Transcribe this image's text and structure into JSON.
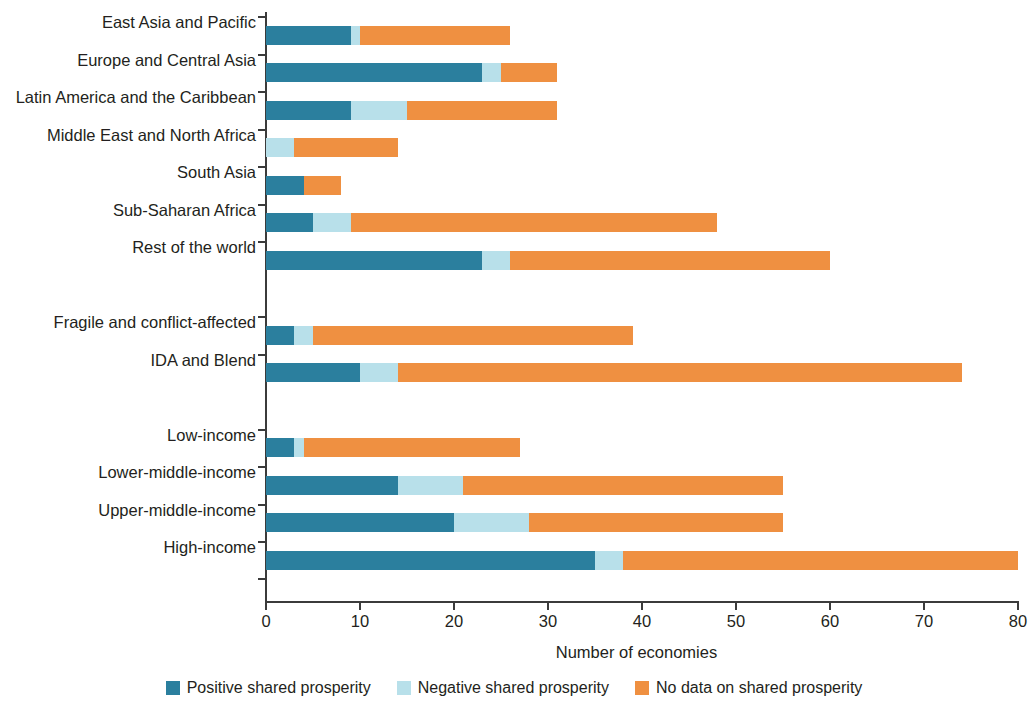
{
  "chart_data": {
    "type": "bar",
    "orientation": "horizontal",
    "stacked": true,
    "title": "",
    "xlabel": "Number of economies",
    "ylabel": "",
    "xlim": [
      0,
      80
    ],
    "xticks": [
      0,
      10,
      20,
      30,
      40,
      50,
      60,
      70,
      80
    ],
    "grid": false,
    "legend_position": "bottom",
    "categories": [
      "East Asia and Pacific",
      "Europe and Central Asia",
      "Latin America and the Caribbean",
      "Middle East and North Africa",
      "South Asia",
      "Sub-Saharan Africa",
      "Rest of the world",
      "Fragile and conflict-affected",
      "IDA and Blend",
      "Low-income",
      "Lower-middle-income",
      "Upper-middle-income",
      "High-income"
    ],
    "group_breaks_after": [
      6,
      8
    ],
    "series": [
      {
        "name": "Positive shared prosperity",
        "color": "#2b7f9e",
        "values": [
          9,
          23,
          9,
          0,
          4,
          5,
          23,
          3,
          10,
          3,
          14,
          20,
          35
        ]
      },
      {
        "name": "Negative shared prosperity",
        "color": "#b8e0ea",
        "values": [
          1,
          2,
          6,
          3,
          0,
          4,
          3,
          2,
          4,
          1,
          7,
          8,
          3
        ]
      },
      {
        "name": "No data on shared prosperity",
        "color": "#ef9041",
        "values": [
          16,
          6,
          16,
          11,
          4,
          39,
          34,
          34,
          60,
          23,
          34,
          27,
          42
        ]
      }
    ],
    "totals": [
      26,
      31,
      31,
      14,
      8,
      48,
      60,
      39,
      74,
      27,
      55,
      55,
      80
    ]
  },
  "legend": {
    "items": [
      {
        "label": "Positive shared prosperity",
        "color": "#2b7f9e"
      },
      {
        "label": "Negative shared prosperity",
        "color": "#b8e0ea"
      },
      {
        "label": "No data on shared prosperity",
        "color": "#ef9041"
      }
    ]
  },
  "axis": {
    "x_title": "Number of economies",
    "x_tick_labels": [
      "0",
      "10",
      "20",
      "30",
      "40",
      "50",
      "60",
      "70",
      "80"
    ]
  }
}
